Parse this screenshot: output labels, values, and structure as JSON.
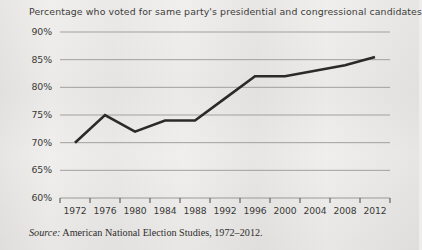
{
  "figure": {
    "title": "Percentage who voted for same party's presidential and congressional candidates",
    "source_lead": "Source:",
    "source_text": "American National Election Studies, 1972–2012."
  },
  "colors": {
    "background": "#eeedeb",
    "line": "#2b2a28",
    "gridline": "#9a9996",
    "axis": "#3a3936",
    "text": "#3a3936"
  },
  "chart_data": {
    "type": "line",
    "title": "Percentage who voted for same party's presidential and congressional candidates",
    "xlabel": "",
    "ylabel": "",
    "x": [
      1972,
      1976,
      1980,
      1984,
      1988,
      1992,
      1996,
      2000,
      2004,
      2008,
      2012
    ],
    "categories": [
      "1972",
      "1976",
      "1980",
      "1984",
      "1988",
      "1992",
      "1996",
      "2000",
      "2004",
      "2008",
      "2012"
    ],
    "values": [
      70,
      75,
      72,
      74,
      74,
      78,
      82,
      82,
      83,
      84,
      85.5
    ],
    "series": [
      {
        "name": "Percentage who voted for same party's presidential and congressional candidates",
        "values": [
          70,
          75,
          72,
          74,
          74,
          78,
          82,
          82,
          83,
          84,
          85.5
        ]
      }
    ],
    "ylim": [
      60,
      90
    ],
    "ytick_values": [
      90,
      85,
      80,
      75,
      70,
      65,
      60
    ],
    "ytick_labels": [
      "90%",
      "85%",
      "80%",
      "75%",
      "70%",
      "65%",
      "60%"
    ],
    "xtick_labels": [
      "1972",
      "1976",
      "1980",
      "1984",
      "1988",
      "1992",
      "1996",
      "2000",
      "2004",
      "2008",
      "2012"
    ],
    "grid": true,
    "grid_axis": "y",
    "legend": false,
    "legend_position": "none"
  }
}
